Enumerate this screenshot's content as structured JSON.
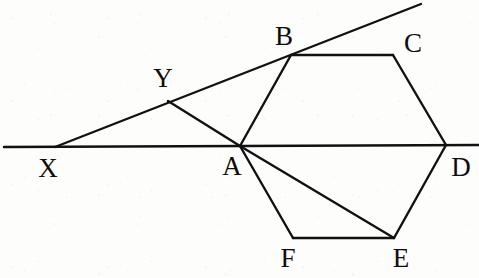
{
  "figure": {
    "kind": "geometry-diagram",
    "canvas": {
      "width": 479,
      "height": 278
    },
    "style": {
      "background_color": "#fdfdfc",
      "stroke_color": "#111111",
      "label_color": "#0d0d0d",
      "stroke_width": 2.4,
      "label_font_size": 27
    },
    "points": [
      {
        "name": "X",
        "x": 55,
        "y": 147,
        "label": "X",
        "label_x": 48,
        "label_y": 168
      },
      {
        "name": "Y",
        "x": 168,
        "y": 101,
        "label": "Y",
        "label_x": 163,
        "label_y": 78
      },
      {
        "name": "A",
        "x": 240,
        "y": 146,
        "label": "A",
        "label_x": 232,
        "label_y": 166
      },
      {
        "name": "B",
        "x": 291,
        "y": 55,
        "label": "B",
        "label_x": 284,
        "label_y": 36
      },
      {
        "name": "C",
        "x": 393,
        "y": 55,
        "label": "C",
        "label_x": 413,
        "label_y": 43
      },
      {
        "name": "D",
        "x": 446,
        "y": 145,
        "label": "D",
        "label_x": 461,
        "label_y": 167
      },
      {
        "name": "E",
        "x": 394,
        "y": 238,
        "label": "E",
        "label_x": 401,
        "label_y": 258
      },
      {
        "name": "F",
        "x": 293,
        "y": 238,
        "label": "F",
        "label_x": 288,
        "label_y": 258
      }
    ],
    "segments": [
      {
        "name": "baseline-XD-extended",
        "x1": 4,
        "y1": 147,
        "x2": 479,
        "y2": 145
      },
      {
        "name": "ray-XB-extended",
        "x1": 55,
        "y1": 147,
        "x2": 421,
        "y2": 4
      },
      {
        "name": "segment-YA",
        "x1": 168,
        "y1": 101,
        "x2": 240,
        "y2": 146
      },
      {
        "name": "hexagon-edge-AB",
        "x1": 240,
        "y1": 146,
        "x2": 291,
        "y2": 55
      },
      {
        "name": "hexagon-edge-BC",
        "x1": 291,
        "y1": 55,
        "x2": 393,
        "y2": 55
      },
      {
        "name": "hexagon-edge-CD",
        "x1": 393,
        "y1": 55,
        "x2": 446,
        "y2": 145
      },
      {
        "name": "hexagon-edge-DE",
        "x1": 446,
        "y1": 145,
        "x2": 394,
        "y2": 238
      },
      {
        "name": "hexagon-edge-EF",
        "x1": 394,
        "y1": 238,
        "x2": 293,
        "y2": 238
      },
      {
        "name": "hexagon-edge-FA",
        "x1": 293,
        "y1": 238,
        "x2": 240,
        "y2": 146
      },
      {
        "name": "chord-AE",
        "x1": 240,
        "y1": 146,
        "x2": 394,
        "y2": 238
      }
    ]
  }
}
